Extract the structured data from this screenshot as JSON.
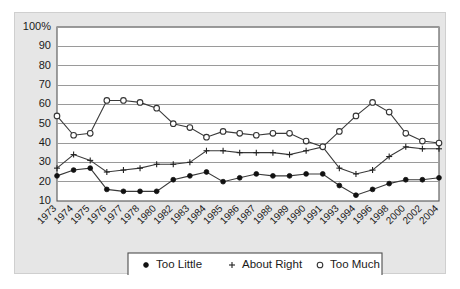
{
  "chart_data": {
    "type": "line",
    "title": "",
    "subtitle": "",
    "xlabel": "",
    "ylabel": "",
    "ylim": [
      10,
      100
    ],
    "ytick_labels": [
      "100%",
      "90",
      "80",
      "70",
      "60",
      "50",
      "40",
      "30",
      "20",
      "10"
    ],
    "ytick_values": [
      100,
      90,
      80,
      70,
      60,
      50,
      40,
      30,
      20,
      10
    ],
    "grid": true,
    "legend_position": "bottom",
    "categories": [
      "1973",
      "1974",
      "1975",
      "1976",
      "1977",
      "1978",
      "1980",
      "1982",
      "1983",
      "1984",
      "1985",
      "1986",
      "1987",
      "1988",
      "1989",
      "1990",
      "1991",
      "1993",
      "1994",
      "1996",
      "1998",
      "2000",
      "2002",
      "2004"
    ],
    "series": [
      {
        "name": "Too Little",
        "marker": "filled-circle",
        "values": [
          23,
          26,
          27,
          16,
          15,
          15,
          15,
          21,
          23,
          25,
          20,
          22,
          24,
          23,
          23,
          24,
          24,
          18,
          13,
          16,
          19,
          21,
          21,
          22
        ]
      },
      {
        "name": "About Right",
        "marker": "plus",
        "values": [
          27,
          34,
          31,
          25,
          26,
          27,
          29,
          29,
          30,
          36,
          36,
          35,
          35,
          35,
          34,
          36,
          38,
          27,
          24,
          26,
          33,
          38,
          37,
          37
        ]
      },
      {
        "name": "Too Much",
        "marker": "open-circle",
        "values": [
          54,
          44,
          45,
          62,
          62,
          61,
          58,
          50,
          48,
          43,
          46,
          45,
          44,
          45,
          45,
          41,
          38,
          46,
          54,
          61,
          56,
          45,
          41,
          40
        ]
      }
    ]
  },
  "legend": {
    "entries": [
      {
        "label": "Too Little",
        "marker": "filled-circle"
      },
      {
        "label": "About Right",
        "marker": "plus"
      },
      {
        "label": "Too Much",
        "marker": "open-circle"
      }
    ]
  }
}
